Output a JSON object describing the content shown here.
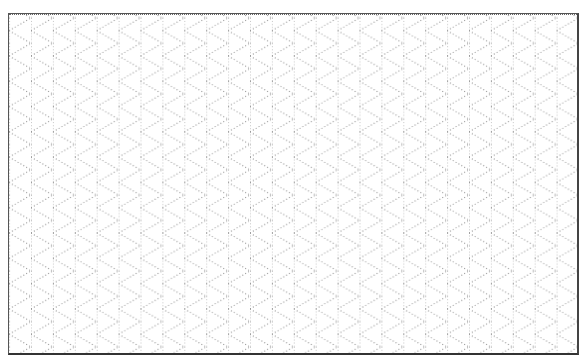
{
  "figure": {
    "type": "isometric-dot-grid",
    "description": "Blank isometric (triangular) dotted grid paper inside a rectangular frame",
    "frame": {
      "x": 8,
      "y": 13,
      "width": 571,
      "height": 342
    },
    "grid": {
      "column_spacing_px": 21.9,
      "row_period_px": 25.3,
      "origin_x": 22,
      "origin_y": 17,
      "line_angle_deg": 30,
      "line_style": "dotted"
    },
    "colors": {
      "background": "#ffffff",
      "frame": "#555555",
      "dots": "#8a8a8a"
    }
  }
}
